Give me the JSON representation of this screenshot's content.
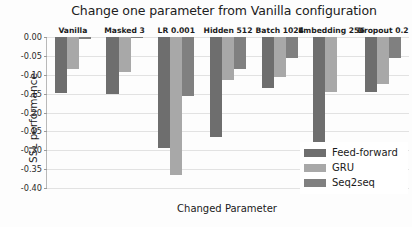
{
  "chart_data": {
    "type": "bar",
    "title": "Change one parameter from Vanilla configuration",
    "xlabel": "Changed Parameter",
    "ylabel": "SSL performance",
    "categories": [
      "Vanilla",
      "Masked 3",
      "LR 0.001",
      "Hidden 512",
      "Batch 1024",
      "Embedding 256",
      "Dropout 0.2"
    ],
    "series": [
      {
        "name": "Feed-forward",
        "color": "#6e6e6e",
        "values": [
          -0.148,
          -0.152,
          -0.295,
          -0.265,
          -0.135,
          -0.285,
          -0.145
        ]
      },
      {
        "name": "GRU",
        "color": "#a8a8a8",
        "values": [
          -0.085,
          -0.092,
          -0.365,
          -0.115,
          -0.105,
          -0.145,
          -0.125
        ]
      },
      {
        "name": "Seq2seq",
        "color": "#808080",
        "values": [
          -0.005,
          -0.003,
          -0.155,
          -0.085,
          -0.055,
          0.0,
          -0.055
        ]
      }
    ],
    "ylim": [
      -0.4,
      0.0
    ],
    "yticks": [
      "0.00",
      "-0.05",
      "-0.10",
      "-0.15",
      "-0.20",
      "-0.25",
      "-0.30",
      "-0.35",
      "-0.40"
    ],
    "ytick_values": [
      0.0,
      -0.05,
      -0.1,
      -0.15,
      -0.2,
      -0.25,
      -0.3,
      -0.35,
      -0.4
    ],
    "grid": true,
    "legend_position": "lower-right"
  }
}
